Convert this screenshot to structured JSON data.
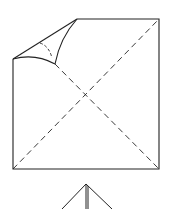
{
  "diagram": {
    "type": "origami-fold-step",
    "stroke_color": "#222222",
    "background": "#ffffff",
    "elements": [
      {
        "name": "square-sheet",
        "kind": "outline"
      },
      {
        "name": "folding-corner-flap",
        "kind": "curved-flap"
      },
      {
        "name": "diagonal-crease-1",
        "kind": "dashed-line"
      },
      {
        "name": "diagonal-crease-2",
        "kind": "dashed-line"
      },
      {
        "name": "next-step-figure",
        "kind": "partial-outline"
      }
    ]
  }
}
